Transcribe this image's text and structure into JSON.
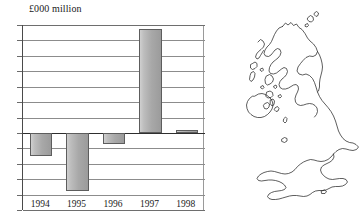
{
  "chart_data": {
    "type": "bar",
    "title": "£000 million",
    "xlabel": "",
    "ylabel": "",
    "categories": [
      "1994",
      "1995",
      "1996",
      "1997",
      "1998"
    ],
    "values": [
      -1.5,
      -3.8,
      -0.75,
      6.75,
      0.2
    ],
    "ylim": [
      -5,
      7
    ],
    "yticks": [
      7,
      6,
      5,
      4,
      3,
      2,
      1,
      0,
      -1,
      -2,
      -3,
      -4,
      -5
    ],
    "ytick_labels": [
      "7",
      "6",
      "5",
      "4",
      "3",
      "2",
      "1",
      "0",
      "–1",
      "–2",
      "–3",
      "–4",
      "–5"
    ],
    "grid": true,
    "legend": false,
    "bar_fill": "#b0b0b0",
    "bar_edge": "#5d5d5d",
    "zero_line_color": "#2e2e2e",
    "gridline_color": "#8c8c8c"
  },
  "map": {
    "name": "united-kingdom-outline-map",
    "stroke_color": "#1a1a1a",
    "fill_color": "#ffffff"
  }
}
